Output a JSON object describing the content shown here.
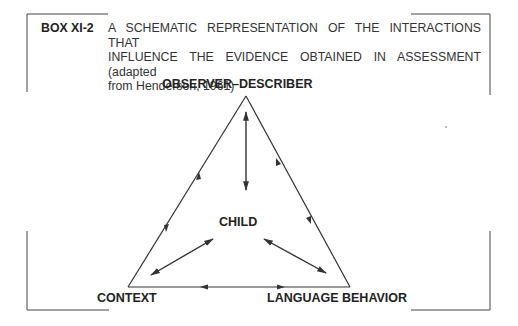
{
  "caption": {
    "box_id": "BOX XI-2",
    "lines": [
      "A SCHEMATIC REPRESENTATION OF THE INTERACTIONS THAT",
      "INFLUENCE THE EVIDENCE OBTAINED IN ASSESSMENT (adapted",
      "from Henderson, 1961)"
    ]
  },
  "diagram": {
    "nodes": {
      "top": "OBSERVER–DESCRIBER",
      "center": "CHILD",
      "bottom_left": "CONTEXT",
      "bottom_right": "LANGUAGE BEHAVIOR"
    },
    "edges": [
      {
        "from": "OBSERVER–DESCRIBER",
        "to": "CONTEXT",
        "type": "bidirectional"
      },
      {
        "from": "OBSERVER–DESCRIBER",
        "to": "LANGUAGE BEHAVIOR",
        "type": "bidirectional"
      },
      {
        "from": "CONTEXT",
        "to": "LANGUAGE BEHAVIOR",
        "type": "bidirectional"
      },
      {
        "from": "CHILD",
        "to": "OBSERVER–DESCRIBER",
        "type": "bidirectional"
      },
      {
        "from": "CHILD",
        "to": "CONTEXT",
        "type": "bidirectional"
      },
      {
        "from": "CHILD",
        "to": "LANGUAGE BEHAVIOR",
        "type": "bidirectional"
      }
    ],
    "line_color": "#333333"
  }
}
